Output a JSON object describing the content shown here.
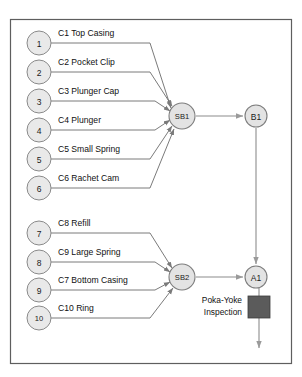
{
  "diagram": {
    "frame": {
      "x": 10,
      "y": 19,
      "width": 282,
      "height": 345
    },
    "colors": {
      "frame_stroke": "#5e5e5e",
      "circle_fill": "#e9e9e9",
      "circle_stroke": "#8a8a8a",
      "node_fill": "#e3e3e3",
      "node_stroke": "#7d7d7d",
      "connector": "#6b6b6b",
      "flow_arrow": "#8c8c8c",
      "inspection_box": "#5b5b5b",
      "text": "#111111",
      "background": "#ffffff"
    },
    "parts_top": [
      {
        "number": "1",
        "label": "C1 Top Casing",
        "cx": 39,
        "cy": 43,
        "r": 12
      },
      {
        "number": "2",
        "label": "C2 Pocket Clip",
        "cx": 39,
        "cy": 72,
        "r": 12
      },
      {
        "number": "3",
        "label": "C3 Plunger Cap",
        "cx": 39,
        "cy": 101,
        "r": 12
      },
      {
        "number": "4",
        "label": "C4 Plunger",
        "cx": 39,
        "cy": 130,
        "r": 12
      },
      {
        "number": "5",
        "label": "C5 Small Spring",
        "cx": 39,
        "cy": 159,
        "r": 12
      },
      {
        "number": "6",
        "label": "C6 Rachet Cam",
        "cx": 39,
        "cy": 188,
        "r": 12
      }
    ],
    "parts_bottom": [
      {
        "number": "7",
        "label": "C8 Refill",
        "cx": 39,
        "cy": 233,
        "r": 12
      },
      {
        "number": "8",
        "label": "C9 Large Spring",
        "cx": 39,
        "cy": 262,
        "r": 12
      },
      {
        "number": "9",
        "label": "C7 Bottom Casing",
        "cx": 39,
        "cy": 290,
        "r": 12
      },
      {
        "number": "10",
        "label": "C10 Ring",
        "cx": 39,
        "cy": 318,
        "r": 12
      }
    ],
    "subassemblies": [
      {
        "id": "SB1",
        "label": "SB1",
        "cx": 182,
        "cy": 116,
        "r": 13
      },
      {
        "id": "SB2",
        "label": "SB2",
        "cx": 182,
        "cy": 277,
        "r": 13
      }
    ],
    "assemblies": [
      {
        "id": "B1",
        "label": "B1",
        "cx": 256,
        "cy": 116,
        "r": 11
      },
      {
        "id": "A1",
        "label": "A1",
        "cx": 256,
        "cy": 277,
        "r": 11
      }
    ],
    "inspection": {
      "label_line1": "Poka-Yoke",
      "label_line2": "Inspection",
      "box": {
        "x": 248,
        "y": 296,
        "width": 22,
        "height": 22
      }
    }
  }
}
